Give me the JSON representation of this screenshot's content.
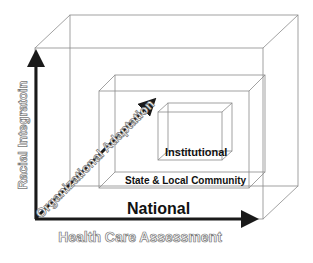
{
  "diagram": {
    "axes": {
      "vertical": "Racial Integratoin",
      "horizontal": "Health Care Assessment",
      "diagonal": "Organizational Adaptation"
    },
    "levels": [
      {
        "name": "National"
      },
      {
        "name": "State & Local Community"
      },
      {
        "name": "Institutional"
      }
    ],
    "colors": {
      "axis": "#1a1a1a",
      "box_edge": "#8a8a8a",
      "outline_text_stroke": "#777777"
    }
  }
}
